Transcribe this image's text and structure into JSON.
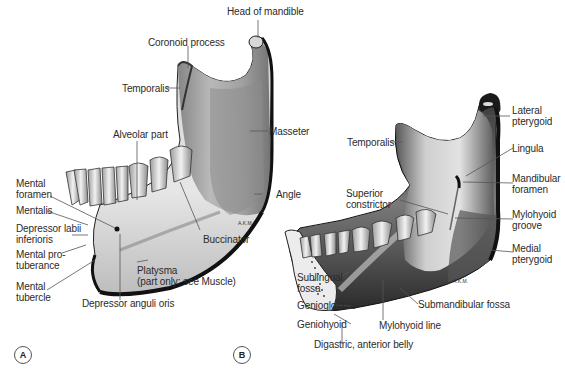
{
  "figure": {
    "panels": [
      {
        "id": "A",
        "view": "lateral",
        "label": "A",
        "labels": {
          "head_of_mandible": "Head of mandible",
          "coronoid_process": "Coronoid process",
          "temporalis": "Temporalis",
          "alveolar_part": "Alveolar part",
          "masseter": "Masseter",
          "angle": "Angle",
          "mental_foramen_1": "Mental",
          "mental_foramen_2": "foramen",
          "mentalis": "Mentalis",
          "depressor_labii_1": "Depressor labii",
          "depressor_labii_2": "inferioris",
          "mental_protuberance_1": "Mental pro-",
          "mental_protuberance_2": "tuberance",
          "mental_tubercle_1": "Mental",
          "mental_tubercle_2": "tubercle",
          "buccinator": "Buccinator",
          "platysma_1": "Platysma",
          "platysma_2": "(part only: see Muscle)",
          "depressor_anguli_oris": "Depressor anguli oris",
          "signature": "A.K.M."
        }
      },
      {
        "id": "B",
        "view": "medial",
        "label": "B",
        "labels": {
          "lateral_pterygoid_1": "Lateral",
          "lateral_pterygoid_2": "pterygoid",
          "temporalis": "Temporalis",
          "lingula": "Lingula",
          "mandibular_foramen_1": "Mandibular",
          "mandibular_foramen_2": "foramen",
          "superior_constrictor_1": "Superior",
          "superior_constrictor_2": "constrictor",
          "mylohyoid_groove_1": "Mylohyoid",
          "mylohyoid_groove_2": "groove",
          "medial_pterygoid_1": "Medial",
          "medial_pterygoid_2": "pterygoid",
          "sublingual_fossa_1": "Sublingual",
          "sublingual_fossa_2": "fossa",
          "genioglossus": "Genioglossus",
          "geniohyoid": "Geniohyoid",
          "submandibular_fossa": "Submandibular fossa",
          "mylohyoid_line": "Mylohyoid line",
          "digastric_anterior_belly": "Digastric, anterior belly",
          "signature": "A.K.M."
        }
      }
    ],
    "colors": {
      "bone_light": "#e4e4e4",
      "bone_mid": "#9a9a9a",
      "bone_dark": "#4a4a4a",
      "muscle_area": "#8c8c8c",
      "outline": "#111111",
      "leader": "#555555",
      "text": "#2b2b2b"
    }
  }
}
